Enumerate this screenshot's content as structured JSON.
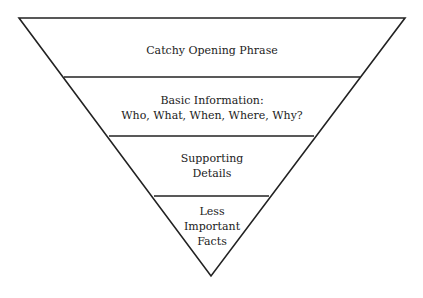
{
  "diagram": {
    "type": "inverted-pyramid",
    "line_color": "#222222",
    "levels": [
      {
        "lines": [
          "Catchy Opening Phrase"
        ]
      },
      {
        "lines": [
          "Basic Information:",
          "Who, What, When, Where, Why?"
        ]
      },
      {
        "lines": [
          "Supporting",
          "Details"
        ]
      },
      {
        "lines": [
          "Less",
          "Important",
          "Facts"
        ]
      }
    ]
  }
}
